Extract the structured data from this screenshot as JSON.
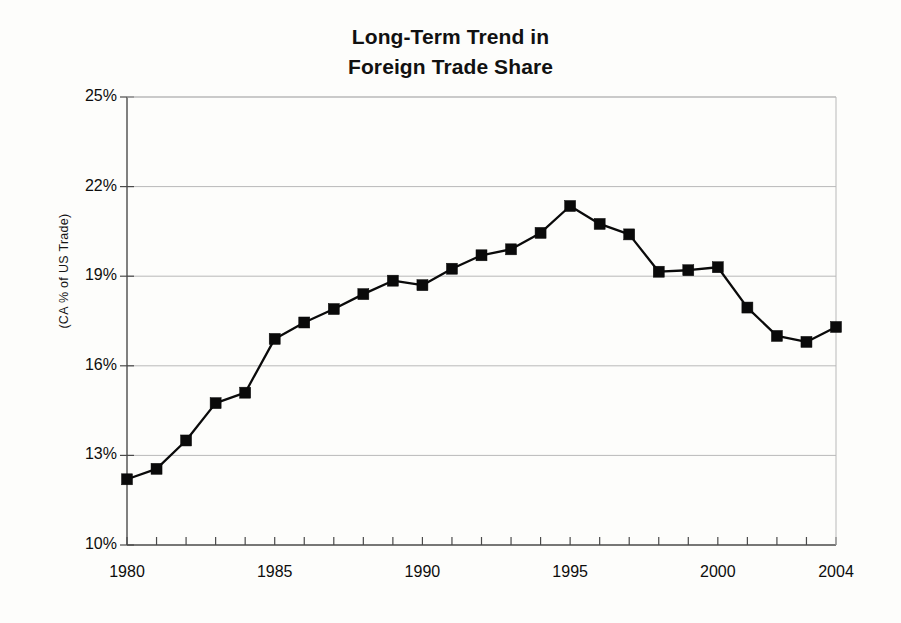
{
  "chart_data": {
    "type": "line",
    "title": "Long-Term Trend in Foreign Trade Share",
    "title_lines": [
      "Long-Term Trend in",
      "Foreign Trade Share"
    ],
    "xlabel": "",
    "ylabel": "(CA % of US Trade)",
    "ylim": [
      10,
      25
    ],
    "xlim": [
      1980,
      2004
    ],
    "grid": "horizontal",
    "legend": "none",
    "y_tick_labels": [
      "25%",
      "22%",
      "19%",
      "16%",
      "13%",
      "10%"
    ],
    "y_tick_values": [
      25,
      22,
      19,
      16,
      13,
      10
    ],
    "x_tick_labels": [
      "1980",
      "1985",
      "1990",
      "1995",
      "2000",
      "2004"
    ],
    "x_tick_values": [
      1980,
      1985,
      1990,
      1995,
      2000,
      2004
    ],
    "x_minor_ticks_every": 1,
    "marker": "filled-square",
    "series_color": "#0a0a0a",
    "grid_color": "#b9b9b9",
    "x": [
      1980,
      1981,
      1982,
      1983,
      1984,
      1985,
      1986,
      1987,
      1988,
      1989,
      1990,
      1991,
      1992,
      1993,
      1994,
      1995,
      1996,
      1997,
      1998,
      1999,
      2000,
      2001,
      2002,
      2003,
      2004
    ],
    "values": [
      12.2,
      12.55,
      13.5,
      14.75,
      15.1,
      16.9,
      17.45,
      17.9,
      18.4,
      18.85,
      18.7,
      19.25,
      19.7,
      19.9,
      20.45,
      21.35,
      20.75,
      20.4,
      19.15,
      19.2,
      19.3,
      17.95,
      17.0,
      16.8,
      17.3
    ]
  }
}
